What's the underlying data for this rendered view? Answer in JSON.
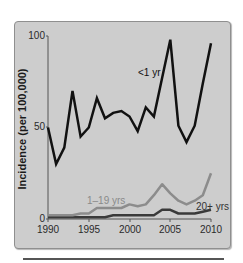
{
  "chart_data": {
    "type": "line",
    "title": "",
    "xlabel": "",
    "ylabel": "Incidence (per 100,000)",
    "xlim": [
      1990,
      2010
    ],
    "ylim": [
      0,
      100
    ],
    "x_ticks": [
      "1990",
      "1995",
      "2000",
      "2005",
      "2010"
    ],
    "y_ticks": [
      "0",
      "50",
      "100"
    ],
    "grid": false,
    "legend_position": "inline labels",
    "x": [
      1990,
      1991,
      1992,
      1993,
      1994,
      1995,
      1996,
      1997,
      1998,
      1999,
      2000,
      2001,
      2002,
      2003,
      2004,
      2005,
      2006,
      2007,
      2008,
      2009,
      2010
    ],
    "series": [
      {
        "name": "<1 yr",
        "color": "#111111",
        "values": [
          50,
          30,
          39,
          70,
          45,
          50,
          66,
          55,
          58,
          59,
          56,
          48,
          61,
          56,
          77,
          98,
          51,
          42,
          51,
          74,
          96
        ]
      },
      {
        "name": "1–19 yrs",
        "color": "#8c8c8c",
        "values": [
          2,
          2,
          2,
          2,
          3,
          3,
          6,
          6,
          6,
          6,
          8,
          7,
          8,
          13,
          19,
          14,
          10,
          8,
          10,
          13,
          25
        ]
      },
      {
        "name": "20+ yrs",
        "color": "#3a3a3a",
        "values": [
          1,
          1,
          1,
          1,
          1,
          1,
          1,
          1,
          2,
          2,
          2,
          2,
          2,
          2,
          5,
          5,
          3,
          3,
          3,
          4,
          5
        ]
      }
    ]
  },
  "labels": {
    "ylabel": "Incidence (per 100,000)",
    "series_lt1": "<1 yr",
    "series_1_19": "1–19 yrs",
    "series_20plus": "20+ yrs",
    "y100": "100",
    "y50": "50",
    "y0": "0",
    "x1990": "1990",
    "x1995": "1995",
    "x2000": "2000",
    "x2005": "2005",
    "x2010": "2010"
  }
}
